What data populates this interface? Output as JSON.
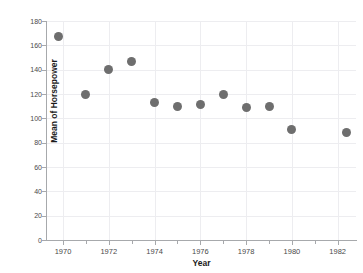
{
  "top_strip": {
    "ghost_a": "——",
    "ghost_b": "··",
    "ghost_c": "—"
  },
  "chart_data": {
    "type": "scatter",
    "title": "",
    "xlabel": "Year",
    "ylabel": "Mean of Horsepower",
    "xlim": [
      1969.3,
      1982.8
    ],
    "ylim": [
      0,
      180
    ],
    "grid": true,
    "legend": "none",
    "marker_color": "#6e6e6e",
    "axis_color": "#a7a9ac",
    "grid_color": "#ededf0",
    "background": "#ffffff",
    "ytick_labels": [
      "0",
      "20",
      "40",
      "60",
      "80",
      "100",
      "120",
      "140",
      "160",
      "180"
    ],
    "ytick_values": [
      0,
      20,
      40,
      60,
      80,
      100,
      120,
      140,
      160,
      180
    ],
    "xtick_labels": [
      "1970",
      "1972",
      "1974",
      "1976",
      "1978",
      "1980",
      "1982"
    ],
    "xtick_values": [
      1970,
      1972,
      1974,
      1976,
      1978,
      1980,
      1982
    ],
    "xtick_minor_values": [
      1971,
      1973,
      1975,
      1977,
      1979,
      1981
    ],
    "x": [
      1969.8,
      1971,
      1972,
      1973,
      1974,
      1975,
      1976,
      1977,
      1978,
      1979,
      1980,
      1982.4
    ],
    "y": [
      167,
      120,
      140,
      147,
      113,
      110,
      111,
      120,
      109,
      110,
      91,
      88
    ],
    "points": [
      {
        "x": 1969.8,
        "y": 167
      },
      {
        "x": 1971.0,
        "y": 120
      },
      {
        "x": 1972.0,
        "y": 140
      },
      {
        "x": 1973.0,
        "y": 147
      },
      {
        "x": 1974.0,
        "y": 113
      },
      {
        "x": 1975.0,
        "y": 110
      },
      {
        "x": 1976.0,
        "y": 111
      },
      {
        "x": 1977.0,
        "y": 120
      },
      {
        "x": 1978.0,
        "y": 109
      },
      {
        "x": 1979.0,
        "y": 110
      },
      {
        "x": 1980.0,
        "y": 91
      },
      {
        "x": 1982.4,
        "y": 88
      }
    ]
  }
}
